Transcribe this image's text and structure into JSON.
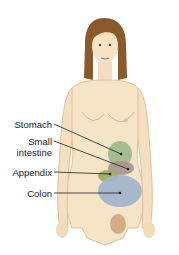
{
  "figure": {
    "labels": [
      {
        "id": "stomach",
        "text": "Stomach"
      },
      {
        "id": "small-intestine",
        "text": "Small intestine",
        "lines": [
          "Small",
          "intestine"
        ]
      },
      {
        "id": "appendix",
        "text": "Appendix"
      },
      {
        "id": "colon",
        "text": "Colon"
      }
    ],
    "colors": {
      "skin": "#f6e4c6",
      "skin_shadow": "#e6c49a",
      "hair": "#8a5a2b",
      "stomach": "#9bb88a",
      "small_intestine": "#a8948c",
      "appendix": "#9aa85a",
      "colon": "#9fb2cc",
      "line": "#222222"
    }
  }
}
